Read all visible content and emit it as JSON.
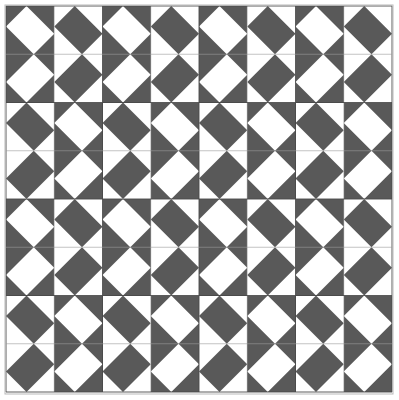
{
  "canvas": {
    "width": 399,
    "height": 400,
    "background_color": "#ffffff"
  },
  "frame": {
    "x": 5,
    "y": 5,
    "width": 388,
    "height": 389,
    "stroke_color": "#b9b9b9",
    "stroke_width": 1,
    "fill_color": "#ffffff"
  },
  "palette": {
    "dark": "#595959",
    "light": "#ffffff",
    "gridline": "#9a9a9a",
    "gridline_major": "#4a4a4a",
    "frame_border": "#b9b9b9"
  },
  "pattern": {
    "name": "diagonal-lattice-quilt",
    "origin_x": 6,
    "origin_y": 6,
    "area_width": 386,
    "area_height": 386,
    "cell_size": 48.25,
    "cells_across": 8,
    "cells_down": 8,
    "block_size": 96.5,
    "blocks_across": 4,
    "blocks_down": 4,
    "band_half_width_ratio": 0.3,
    "description": "Each cell holds one diagonal band; band color and diagonal direction alternate in a checkerboard so the bands chain into continuous diagonal ribbons across the whole field."
  },
  "grid": {
    "show": true,
    "minor_spacing": 48.25,
    "major_spacing": 96.5,
    "minor_color": "#9a9a9a",
    "major_color": "#4a4a4a",
    "minor_width": 0.6,
    "major_width": 0.9,
    "vertical_positions": [
      6,
      54.25,
      102.5,
      150.75,
      199,
      247.25,
      295.5,
      343.75,
      392
    ],
    "horizontal_positions": [
      6,
      54.25,
      102.5,
      150.75,
      199,
      247.25,
      295.5,
      343.75,
      392
    ]
  },
  "cell_matrix": {
    "legend": {
      "0": "dark background with white diagonal band, NW-SE slope",
      "1": "white background with dark diagonal band, NW-SE slope",
      "2": "dark background with white diagonal band, NE-SW slope",
      "3": "white background with dark diagonal band, NE-SW slope"
    },
    "rows": [
      [
        0,
        1,
        0,
        1,
        0,
        1,
        0,
        1
      ],
      [
        2,
        3,
        2,
        3,
        2,
        3,
        2,
        3
      ],
      [
        1,
        0,
        1,
        0,
        1,
        0,
        1,
        0
      ],
      [
        3,
        2,
        3,
        2,
        3,
        2,
        3,
        2
      ],
      [
        0,
        1,
        0,
        1,
        0,
        1,
        0,
        1
      ],
      [
        2,
        3,
        2,
        3,
        2,
        3,
        2,
        3
      ],
      [
        1,
        0,
        1,
        0,
        1,
        0,
        1,
        0
      ],
      [
        3,
        2,
        3,
        2,
        3,
        2,
        3,
        2
      ]
    ]
  },
  "labels": {
    "title": "",
    "caption": ""
  }
}
